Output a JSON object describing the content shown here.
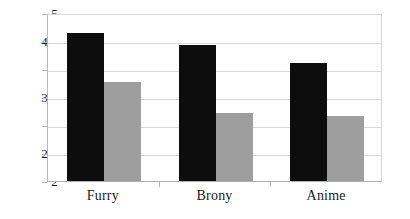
{
  "chart_data": {
    "type": "bar",
    "title": "",
    "subtitle": "",
    "xlabel": "",
    "ylabel": "",
    "categories": [
      "Furry",
      "Brony",
      "Anime"
    ],
    "series": [
      {
        "name": "Series 1",
        "color": "#0d0d0d",
        "values": [
          4.65,
          4.43,
          4.1
        ]
      },
      {
        "name": "Series 2",
        "color": "#9e9e9e",
        "values": [
          3.77,
          3.22,
          3.17
        ]
      }
    ],
    "ylim": [
      2,
      5
    ],
    "ytick_values": [
      2,
      2.5,
      3,
      3.5,
      4,
      4.5,
      5
    ],
    "ytick_labels": [
      "2",
      "2.5",
      "3",
      "3.5",
      "4",
      "4.5",
      "5"
    ],
    "grid": true,
    "grid_axis": "y",
    "legend": false,
    "legend_position": "none",
    "axis_color": "#b8b8b8",
    "grid_color": "#d9d9d9",
    "background": "#ffffff"
  }
}
